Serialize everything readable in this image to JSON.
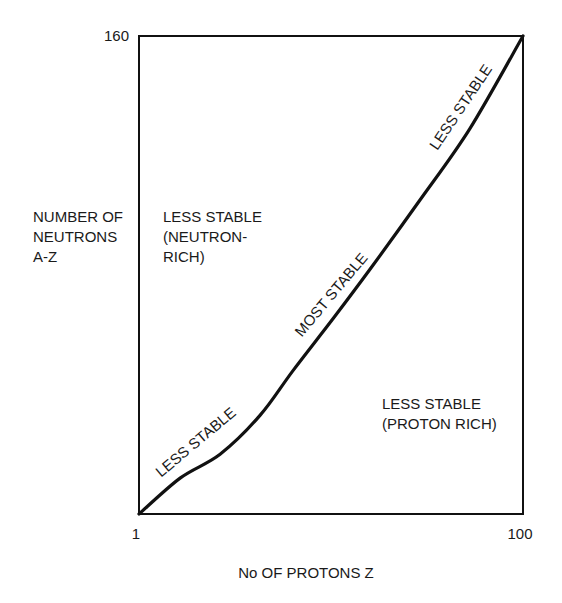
{
  "chart_data": {
    "type": "line",
    "title": "",
    "xlabel": "No OF PROTONS Z",
    "ylabel_lines": [
      "NUMBER OF",
      "NEUTRONS",
      "A-Z"
    ],
    "xlim": [
      1,
      100
    ],
    "ylim": [
      0,
      160
    ],
    "x_ticks": [
      {
        "value": 1,
        "label": "1"
      },
      {
        "value": 100,
        "label": "100"
      }
    ],
    "y_ticks": [
      {
        "value": 160,
        "label": "160"
      }
    ],
    "grid": false,
    "series": [
      {
        "name": "stability curve",
        "color": "#111111",
        "points": [
          {
            "x": 1,
            "y": 0
          },
          {
            "x": 11.6,
            "y": 12
          },
          {
            "x": 21.9,
            "y": 20
          },
          {
            "x": 32.2,
            "y": 33
          },
          {
            "x": 40.7,
            "y": 48
          },
          {
            "x": 50.8,
            "y": 65
          },
          {
            "x": 60.6,
            "y": 82
          },
          {
            "x": 73.4,
            "y": 105
          },
          {
            "x": 86.3,
            "y": 129
          },
          {
            "x": 100,
            "y": 160
          }
        ]
      }
    ],
    "curve_annotations": [
      {
        "text": "LESS STABLE",
        "at_x": 18,
        "at_y": 22
      },
      {
        "text": "MOST STABLE",
        "at_x": 52,
        "at_y": 73
      },
      {
        "text": "LESS STABLE",
        "at_x": 87,
        "at_y": 136
      }
    ],
    "region_annotations": [
      {
        "lines": [
          "LESS STABLE",
          "(NEUTRON-",
          "RICH)"
        ],
        "region": "upper-left"
      },
      {
        "lines": [
          "LESS STABLE",
          "(PROTON RICH)"
        ],
        "region": "lower-right"
      }
    ]
  }
}
